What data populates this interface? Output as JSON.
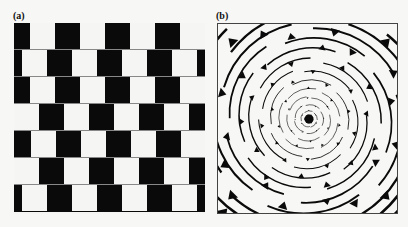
{
  "figure": {
    "panels": [
      {
        "id": "a",
        "label": "(a)",
        "name": "cafe-wall-illusion"
      },
      {
        "id": "b",
        "label": "(b)",
        "name": "spiral-illusion"
      }
    ]
  },
  "cafe_wall": {
    "rows": 7,
    "row_height": 27,
    "tile_width": 25,
    "period": 50,
    "white_offsets": [
      16,
      8,
      16,
      0,
      17,
      0,
      8
    ],
    "colors": {
      "dark": "#0a0a0a",
      "light": "#f5f5f3",
      "mortar": "#888888"
    }
  },
  "spiral": {
    "center": [
      91,
      95
    ],
    "rings": 16,
    "colors": {
      "ink": "#0a0a0a",
      "paper": "#f7f7f5"
    }
  }
}
